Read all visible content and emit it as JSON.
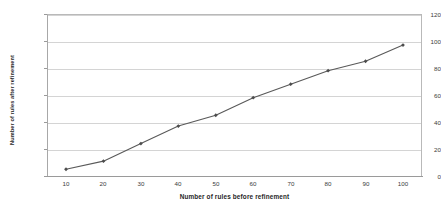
{
  "chart_data": {
    "type": "line",
    "title": "",
    "subtitle": "",
    "xlabel": "Number of rules before refinement",
    "ylabel": "Number of rules after refinement",
    "x": [
      10,
      20,
      30,
      40,
      50,
      60,
      70,
      80,
      90,
      100
    ],
    "values": [
      5,
      11,
      24,
      37,
      45,
      58,
      68,
      78,
      85,
      97
    ],
    "series": [
      {
        "name": "Number of rules after refinement",
        "values": [
          5,
          11,
          24,
          37,
          45,
          58,
          68,
          78,
          85,
          97
        ]
      }
    ],
    "xlim": [
      5,
      105
    ],
    "ylim": [
      0,
      120
    ],
    "ytick_labels": [
      "0",
      "20",
      "40",
      "60",
      "80",
      "100",
      "120"
    ],
    "ytick_values": [
      0,
      20,
      40,
      60,
      80,
      100,
      120
    ],
    "xtick_labels": [
      "10",
      "20",
      "30",
      "40",
      "50",
      "60",
      "70",
      "80",
      "90",
      "100"
    ],
    "xtick_values": [
      10,
      20,
      30,
      40,
      50,
      60,
      70,
      80,
      90,
      100
    ],
    "grid": "horizontal",
    "legend_position": "none",
    "marker": "diamond",
    "line_color": "#595959",
    "marker_color": "#4d4d4d",
    "grid_color": "#d4d4d4",
    "frame_color": "#b9b9b9",
    "background_color": "#ffffff",
    "text_color": "#3a3a3a"
  }
}
